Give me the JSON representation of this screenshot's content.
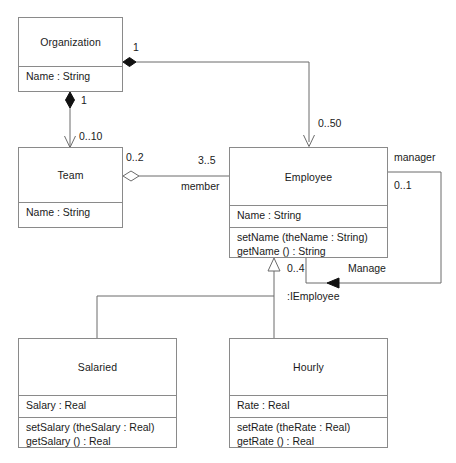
{
  "diagram": {
    "classes": [
      {
        "id": "organization",
        "name": "Organization",
        "attributes": [
          "Name : String"
        ],
        "operations": []
      },
      {
        "id": "team",
        "name": "Team",
        "attributes": [
          "Name : String"
        ],
        "operations": []
      },
      {
        "id": "employee",
        "name": "Employee",
        "attributes": [
          "Name : String"
        ],
        "operations": [
          "setName (theName : String)",
          "getName () : String"
        ]
      },
      {
        "id": "salaried",
        "name": "Salaried",
        "attributes": [
          "Salary : Real"
        ],
        "operations": [
          "setSalary (theSalary : Real)",
          "getSalary () : Real"
        ]
      },
      {
        "id": "hourly",
        "name": "Hourly",
        "attributes": [
          "Rate : Real"
        ],
        "operations": [
          "setRate (theRate : Real)",
          "getRate () : Real"
        ]
      }
    ],
    "labels": {
      "org_employee_source": "1",
      "org_employee_target": "0..50",
      "org_team_source": "1",
      "org_team_target": "0..10",
      "team_employee_source": "0..2",
      "team_employee_target": "3..5",
      "team_employee_role": "member",
      "manager_role": "manager",
      "manager_mult": "0..1",
      "managed_mult": "0..4",
      "manage_assoc": "Manage",
      "interface_label": ":IEmployee"
    },
    "colors": {
      "stroke": "#8a8a8a",
      "line": "#6b6b6b",
      "text": "#1a1a1a",
      "fill": "#ffffff",
      "solid_marker": "#111111"
    }
  }
}
